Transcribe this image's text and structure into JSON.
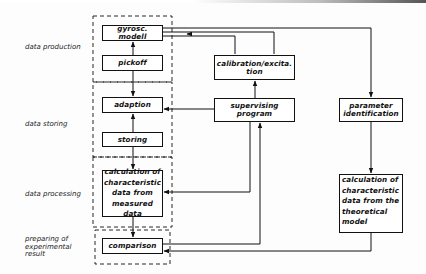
{
  "diagram": {
    "row_labels": {
      "data_production": "data production",
      "data_storing": "data storing",
      "data_processing": "data processing",
      "preparing_line1": "preparing of",
      "preparing_line2": "experimental",
      "preparing_line3": "result"
    },
    "boxes": {
      "gyrosc_modell": "gyrosc. modell",
      "pickoff": "pickoff",
      "adaption": "adaption",
      "storing": "storing",
      "calc_measured_l1": "calculation of",
      "calc_measured_l2": "characteristic",
      "calc_measured_l3": "data from",
      "calc_measured_l4": "measured data",
      "comparison": "comparison",
      "calibration_l1": "calibration/excita.",
      "calibration_l2": "tion",
      "supervising_l1": "supervising",
      "supervising_l2": "program",
      "parameter_l1": "parameter",
      "parameter_l2": "identification",
      "calc_theoretical_l1": "calculation of",
      "calc_theoretical_l2": "characteristic",
      "calc_theoretical_l3": "data from the",
      "calc_theoretical_l4": "theoretical",
      "calc_theoretical_l5": "model"
    },
    "colors": {
      "ink": "#111111",
      "background": "#fdfdfd"
    }
  }
}
